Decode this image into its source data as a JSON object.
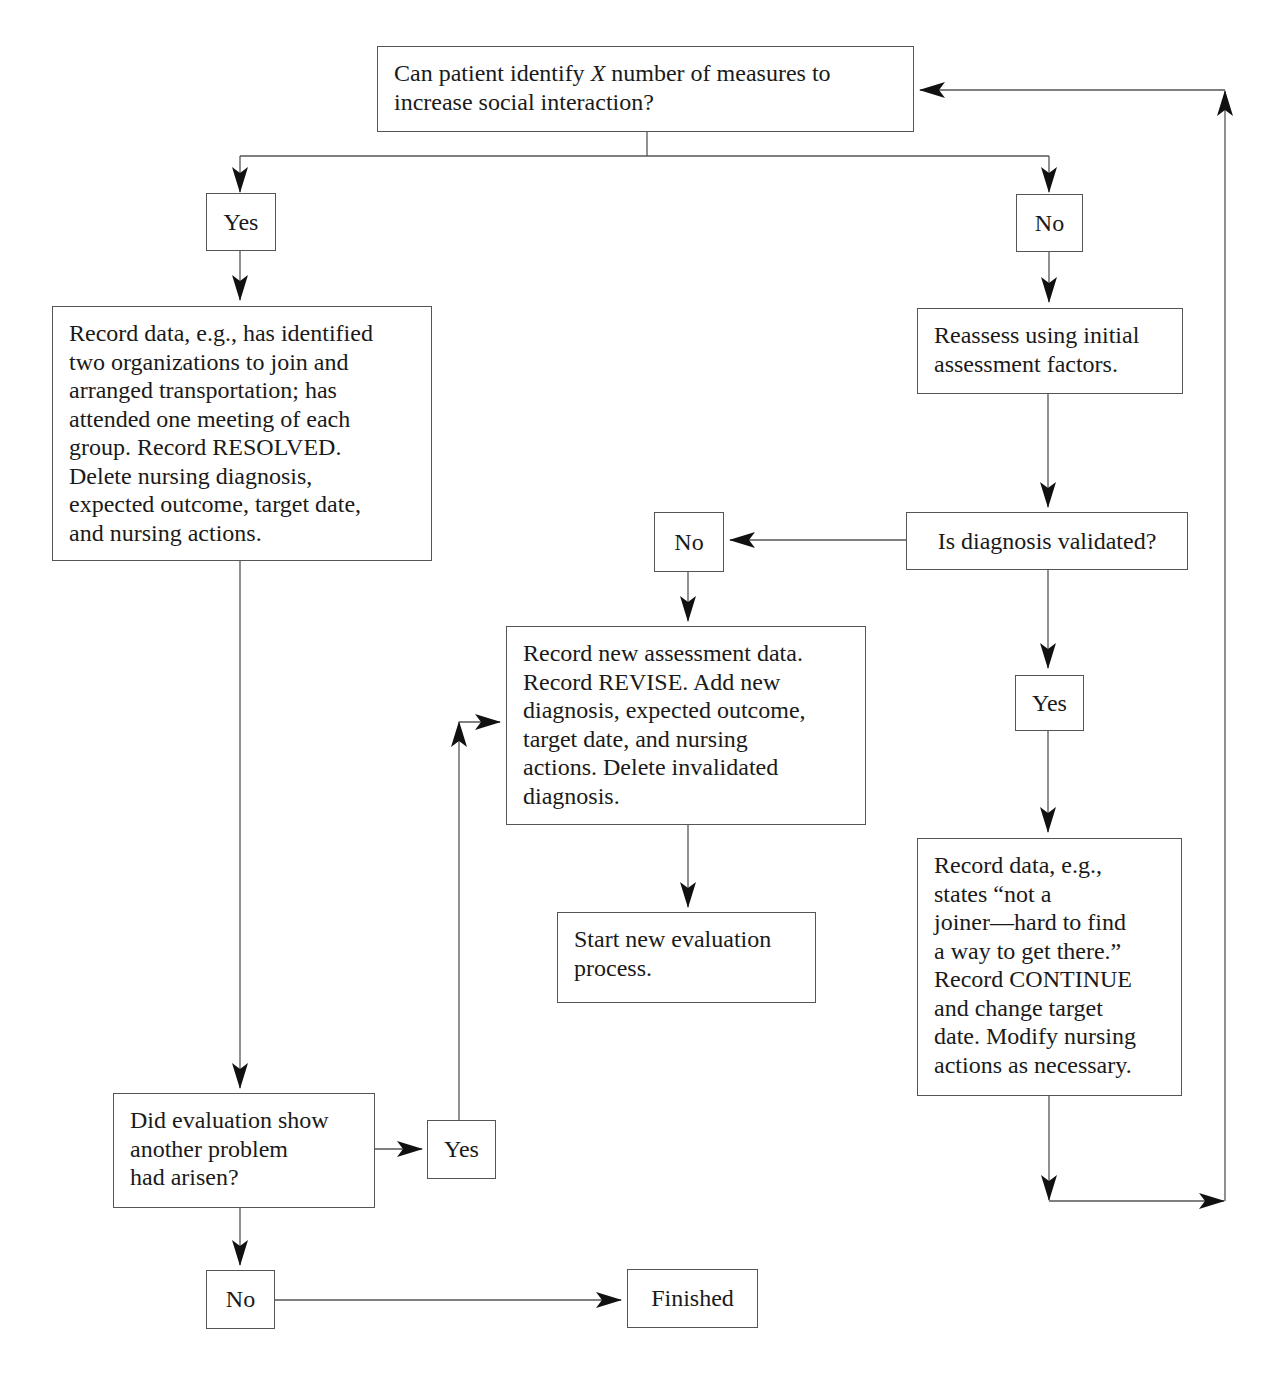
{
  "diagram": {
    "type": "flowchart",
    "topic": "Nursing evaluation process for social interaction outcome",
    "colors": {
      "line": "#555555",
      "text": "#1a1a1a",
      "background": "#ffffff",
      "arrowhead": "#111111"
    },
    "nodes": {
      "start_question": {
        "text_before": "Can patient identify ",
        "variable": "X",
        "text_after": " number of measures to\nincrease social interaction?"
      },
      "yes_1": {
        "text": "Yes"
      },
      "no_1": {
        "text": "No"
      },
      "record_resolved": {
        "text": "Record data, e.g., has identified\ntwo organizations to join and\narranged transportation; has\nattended one meeting of each\ngroup.  Record RESOLVED.\nDelete nursing diagnosis,\nexpected outcome, target date,\nand nursing actions."
      },
      "reassess": {
        "text": "Reassess using initial\nassessment factors."
      },
      "diagnosis_validated": {
        "text": "Is diagnosis validated?"
      },
      "no_2": {
        "text": "No"
      },
      "record_revise": {
        "text": "Record new assessment data.\nRecord REVISE. Add new\ndiagnosis, expected outcome,\ntarget date, and nursing\nactions. Delete invalidated\ndiagnosis."
      },
      "start_new_eval": {
        "text": "Start new evaluation\nprocess."
      },
      "yes_2": {
        "text": "Yes"
      },
      "record_continue": {
        "text": "Record data, e.g.,\nstates “not a\njoiner—hard to find\na way to get there.”\nRecord CONTINUE\nand change target\ndate. Modify nursing\nactions as necessary."
      },
      "another_problem": {
        "text": "Did evaluation show\nanother problem\nhad arisen?"
      },
      "yes_3": {
        "text": "Yes"
      },
      "no_3": {
        "text": "No"
      },
      "finished": {
        "text": "Finished"
      }
    },
    "edges": [
      {
        "from": "start_question",
        "to": "yes_1"
      },
      {
        "from": "start_question",
        "to": "no_1"
      },
      {
        "from": "yes_1",
        "to": "record_resolved"
      },
      {
        "from": "no_1",
        "to": "reassess"
      },
      {
        "from": "reassess",
        "to": "diagnosis_validated"
      },
      {
        "from": "diagnosis_validated",
        "to": "no_2"
      },
      {
        "from": "diagnosis_validated",
        "to": "yes_2"
      },
      {
        "from": "no_2",
        "to": "record_revise"
      },
      {
        "from": "record_revise",
        "to": "start_new_eval"
      },
      {
        "from": "yes_2",
        "to": "record_continue"
      },
      {
        "from": "record_continue",
        "to": "start_question",
        "label": "loop back"
      },
      {
        "from": "record_resolved",
        "to": "another_problem"
      },
      {
        "from": "another_problem",
        "to": "yes_3"
      },
      {
        "from": "another_problem",
        "to": "no_3"
      },
      {
        "from": "yes_3",
        "to": "record_revise"
      },
      {
        "from": "no_3",
        "to": "finished"
      }
    ]
  }
}
